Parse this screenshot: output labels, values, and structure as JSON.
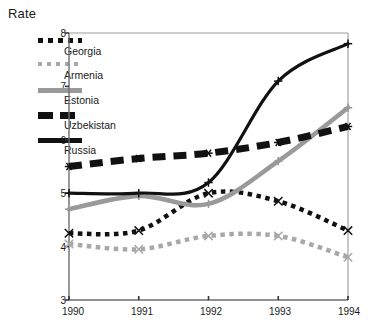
{
  "chart_data": {
    "type": "line",
    "title": "",
    "ylabel": "Rate",
    "xlabel": "",
    "grid": false,
    "legend_position": "upper-left",
    "x": [
      1990,
      1991,
      1992,
      1993,
      1994
    ],
    "categories": [
      "1990",
      "1991",
      "1992",
      "1993",
      "1994"
    ],
    "xlim": [
      1990,
      1994
    ],
    "ylim": [
      3,
      8
    ],
    "yticks": [
      3,
      4,
      5,
      6,
      7,
      8
    ],
    "xticks": [
      "1990",
      "1991",
      "1992",
      "1993",
      "1994"
    ],
    "series": [
      {
        "name": "Georgia",
        "style": "dotted",
        "color": "#111111",
        "marker": "x",
        "values": [
          4.25,
          4.3,
          5.0,
          4.85,
          4.3
        ]
      },
      {
        "name": "Armenia",
        "style": "dotted",
        "color": "#a8a8a8",
        "marker": "x",
        "values": [
          4.05,
          3.95,
          4.2,
          4.2,
          3.8
        ]
      },
      {
        "name": "Estonia",
        "style": "solid-thick",
        "color": "#9a9a9a",
        "marker": "plus",
        "values": [
          4.7,
          4.95,
          4.8,
          5.6,
          6.6
        ]
      },
      {
        "name": "Uzbekistan",
        "style": "dashed",
        "color": "#111111",
        "marker": "asterisk",
        "values": [
          5.5,
          5.65,
          5.75,
          5.95,
          6.25
        ]
      },
      {
        "name": "Russia",
        "style": "solid",
        "color": "#111111",
        "marker": "plus",
        "values": [
          5.0,
          5.0,
          5.2,
          7.1,
          7.8
        ]
      }
    ]
  },
  "legend": {
    "items": [
      {
        "label": "Georgia"
      },
      {
        "label": "Armenia"
      },
      {
        "label": "Estonia"
      },
      {
        "label": "Uzbekistan"
      },
      {
        "label": "Russia"
      }
    ]
  },
  "axes": {
    "y_title": "Rate",
    "y_labels": [
      "8",
      "7",
      "6",
      "5",
      "4",
      "3"
    ],
    "x_labels": [
      "1990",
      "1991",
      "1992",
      "1993",
      "1994"
    ]
  },
  "colors": {
    "axis": "#6e6e6e",
    "dark": "#111111",
    "mid_gray": "#9a9a9a",
    "light_gray": "#a8a8a8",
    "background": "#ffffff"
  }
}
